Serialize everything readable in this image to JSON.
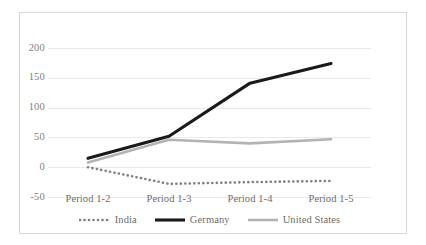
{
  "chart_data": {
    "type": "line",
    "title": "",
    "subtitle": "",
    "xlabel": "",
    "ylabel": "",
    "categories": [
      "Period 1-2",
      "Period 1-3",
      "Period 1-4",
      "Period 1-5"
    ],
    "yticks": [
      "200",
      "150",
      "100",
      "50",
      "0",
      "-50"
    ],
    "ytick_values": [
      200,
      150,
      100,
      50,
      0,
      -50
    ],
    "ylim": [
      -50,
      200
    ],
    "grid": "horizontal",
    "legend_position": "bottom",
    "series": [
      {
        "name": "India",
        "values": [
          0,
          -28,
          -25,
          -23
        ],
        "color": "#7f7f7f",
        "style": "dotted",
        "width": 2.6
      },
      {
        "name": "Germany",
        "values": [
          15,
          52,
          141,
          174
        ],
        "color": "#1a1a1a",
        "style": "solid",
        "width": 3.1
      },
      {
        "name": "United States",
        "values": [
          8,
          46,
          40,
          47
        ],
        "color": "#b3b3b3",
        "style": "solid",
        "width": 2.6
      }
    ],
    "annotations": []
  },
  "legend": {
    "items": [
      {
        "label": "India"
      },
      {
        "label": "Germany"
      },
      {
        "label": "United States"
      }
    ]
  },
  "colors": {
    "grid": "#e9e9e9",
    "frame": "#d7d7d7",
    "tick_text": "#808080",
    "axis_text": "#6d6d6d",
    "india": "#7f7f7f",
    "germany": "#1a1a1a",
    "united_states": "#b3b3b3"
  }
}
